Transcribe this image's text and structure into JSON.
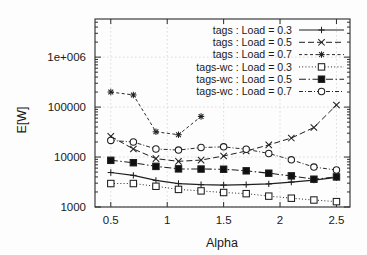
{
  "chart": {
    "title": "",
    "xlabel": "Alpha",
    "ylabel": "E[W]",
    "xticks": [
      "0.5",
      "1",
      "1.5",
      "2",
      "2.5"
    ],
    "yticks": [
      "1000",
      "10000",
      "100000",
      "1e+006"
    ]
  },
  "chart_data": {
    "type": "line",
    "title": "",
    "xlabel": "Alpha",
    "ylabel": "E[W]",
    "xlim": [
      0.36,
      2.62
    ],
    "ylim": [
      1000,
      5800000
    ],
    "yscale": "log",
    "xscale": "linear",
    "grid": true,
    "legend_position": "top-right",
    "xtick_values": [
      0.5,
      1,
      1.5,
      2,
      2.5
    ],
    "xtick_labels": [
      "0.5",
      "1",
      "1.5",
      "2",
      "2.5"
    ],
    "ytick_values": [
      1000,
      10000,
      100000,
      1000000
    ],
    "ytick_labels": [
      "1000",
      "10000",
      "100000",
      "1e+006"
    ],
    "x": [
      0.5,
      0.7,
      0.9,
      1.1,
      1.3,
      1.5,
      1.7,
      1.9,
      2.1,
      2.3,
      2.5
    ],
    "series": [
      {
        "name": "tags : Load = 0.3",
        "marker": "plus",
        "line": "solid",
        "values": [
          4900,
          4300,
          3400,
          2950,
          2800,
          2750,
          2800,
          2900,
          3150,
          3450,
          3900
        ]
      },
      {
        "name": "tags : Load = 0.5",
        "marker": "cross",
        "line": "dashed",
        "values": [
          26000,
          14500,
          9300,
          8200,
          8700,
          10500,
          13200,
          17500,
          24000,
          39000,
          110000
        ]
      },
      {
        "name": "tags : Load = 0.7",
        "marker": "star",
        "line": "dashed-fine",
        "values": [
          200000,
          175000,
          32000,
          28000,
          65000,
          null,
          null,
          null,
          null,
          null,
          null
        ]
      },
      {
        "name": "tags-wc : Load = 0.3",
        "marker": "square-open",
        "line": "dotted",
        "values": [
          2950,
          2950,
          2600,
          2250,
          2100,
          1950,
          1850,
          1650,
          1500,
          1380,
          1280
        ]
      },
      {
        "name": "tags-wc : Load = 0.5",
        "marker": "square-filled",
        "line": "dashdot",
        "values": [
          8600,
          7700,
          6500,
          5800,
          5750,
          5700,
          5300,
          4750,
          4200,
          3600,
          4000
        ]
      },
      {
        "name": "tags-wc : Load = 0.7",
        "marker": "circle-open",
        "line": "dashdot-fine",
        "values": [
          21500,
          20000,
          14500,
          13800,
          15500,
          16000,
          14300,
          11800,
          8800,
          6300,
          5500
        ]
      }
    ]
  },
  "legend": {
    "items": [
      {
        "label": "tags : Load = 0.3"
      },
      {
        "label": "tags : Load = 0.5"
      },
      {
        "label": "tags : Load = 0.7"
      },
      {
        "label": "tags-wc : Load = 0.3"
      },
      {
        "label": "tags-wc : Load = 0.5"
      },
      {
        "label": "tags-wc : Load = 0.7"
      }
    ]
  },
  "colors": {
    "ink": "#1f1f1f",
    "grid": "#cfcfcf",
    "background": "#fdfdfd"
  }
}
